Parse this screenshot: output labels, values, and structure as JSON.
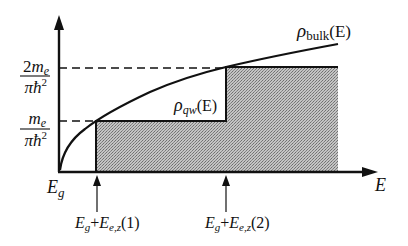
{
  "diagram": {
    "axes": {
      "x_label": "E",
      "origin_label_main": "E",
      "origin_label_sub": "g"
    },
    "y_ticks": [
      {
        "num_coef": "2",
        "num_var": "m",
        "num_sub": "e",
        "den": "πħ",
        "den_sup": "2",
        "meaning": "2m_e/(πħ²)"
      },
      {
        "num_coef": "",
        "num_var": "m",
        "num_sub": "e",
        "den": "πħ",
        "den_sup": "2",
        "meaning": "m_e/(πħ²)"
      }
    ],
    "x_markers": [
      {
        "a": "E",
        "a_sub": "g",
        "plus": "+",
        "b": "E",
        "b_sub": "e,z",
        "arg": "(1)"
      },
      {
        "a": "E",
        "a_sub": "g",
        "plus": "+",
        "b": "E",
        "b_sub": "e,z",
        "arg": "(2)"
      }
    ],
    "curves": [
      {
        "name": "bulk",
        "symbol": "ρ",
        "sub": "bulk",
        "arg": "(E)",
        "shape": "square-root"
      },
      {
        "name": "quantum-well",
        "symbol": "ρ",
        "sub": "qw",
        "arg": "(E)",
        "shape": "staircase"
      }
    ],
    "colors": {
      "line": "#111111",
      "shade": "#a9a9a9"
    }
  }
}
